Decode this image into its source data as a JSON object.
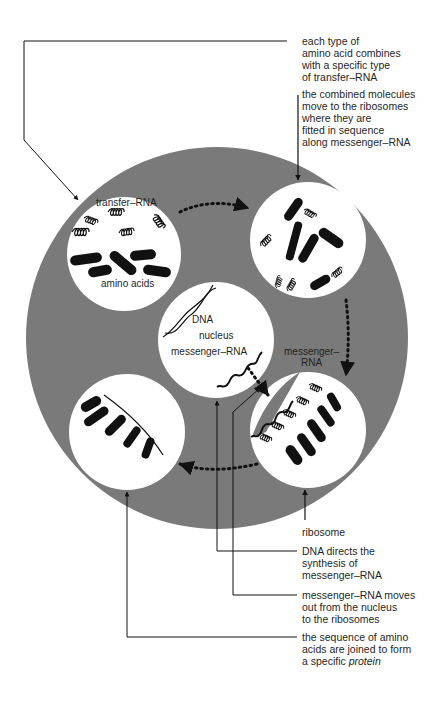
{
  "colors": {
    "disc": "#7a7a7a",
    "circle": "#ffffff",
    "ink": "#111111",
    "background": "#ffffff"
  },
  "stages": {
    "transfer": {
      "top_label": "transfer–RNA",
      "bottom_label": "amino acids"
    },
    "nucleus": {
      "dna": "DNA",
      "nucleus": "nucleus",
      "mrna": "messenger–RNA"
    },
    "ribosome": {
      "label_line1": "messenger–",
      "label_line2": "RNA"
    }
  },
  "annotations": {
    "amino_acid_combines": [
      "each type of",
      "amino acid combines",
      "with a specific type",
      "of transfer–RNA"
    ],
    "combined_move": [
      "the combined molecules",
      "move to the ribosomes",
      "where they are",
      "fitted in sequence",
      "along messenger–RNA"
    ],
    "ribosome": [
      "ribosome"
    ],
    "dna_directs": [
      "DNA directs the",
      "synthesis of",
      "messenger–RNA"
    ],
    "mrna_moves": [
      "messenger–RNA moves",
      "out from the nucleus",
      "to the ribosomes"
    ],
    "protein": {
      "line1": "the sequence of amino",
      "line2": "acids are joined to form",
      "line3_prefix": "a specific ",
      "line3_italic": "protein"
    }
  }
}
